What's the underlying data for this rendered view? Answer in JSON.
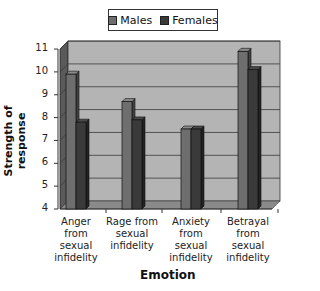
{
  "chart_data": {
    "type": "bar",
    "style": "3d-clustered-column",
    "title": "",
    "xlabel": "Emotion",
    "ylabel": "Strength of response",
    "ylim": [
      4,
      11
    ],
    "yticks": [
      4,
      5,
      6,
      7,
      8,
      9,
      10,
      11
    ],
    "grid": true,
    "legend_position": "top",
    "categories": [
      "Anger from sexual infidelity",
      "Rage from sexual infidelity",
      "Anxiety from sexual infidelity",
      "Betrayal from sexual infidelity"
    ],
    "category_lines": [
      [
        "Anger",
        "from",
        "sexual",
        "infidelity"
      ],
      [
        "Rage from",
        "sexual",
        "infidelity"
      ],
      [
        "Anxiety",
        "from",
        "sexual",
        "infidelity"
      ],
      [
        "Betrayal",
        "from",
        "sexual",
        "infidelity"
      ]
    ],
    "series": [
      {
        "name": "Males",
        "values": [
          9.9,
          8.7,
          7.5,
          10.9
        ],
        "color": "#6e6e6e"
      },
      {
        "name": "Females",
        "values": [
          7.8,
          7.9,
          7.5,
          10.1
        ],
        "color": "#3a3a3a"
      }
    ]
  },
  "legend": {
    "males": "Males",
    "females": "Females"
  },
  "axis": {
    "x_title": "Emotion",
    "y_title": "Strength of response"
  }
}
